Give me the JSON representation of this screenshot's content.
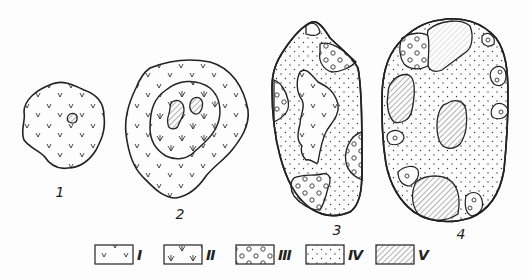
{
  "figure": {
    "type": "schematic diagram of zoned bodies (stages)",
    "stages": [
      {
        "id": "stage-1",
        "label": "1",
        "composition": [
          "I (v-pattern matrix)",
          "V (small hatched core)"
        ]
      },
      {
        "id": "stage-2",
        "label": "2",
        "composition": [
          "I (outer v-pattern zone)",
          "II (inner arrow-v zone)",
          "V (two hatched cores)"
        ]
      },
      {
        "id": "stage-3",
        "label": "3",
        "composition": [
          "IV (dotted matrix)",
          "I (central v-pattern relic)",
          "III (circle-pattern patches at margins)"
        ]
      },
      {
        "id": "stage-4",
        "label": "4",
        "composition": [
          "IV (dotted matrix)",
          "III (small circle-pattern patches)",
          "V (hatched bodies)"
        ]
      }
    ]
  },
  "legend": {
    "items": [
      {
        "key": "I",
        "pattern": "small-v-marks"
      },
      {
        "key": "II",
        "pattern": "arrow-v-marks"
      },
      {
        "key": "III",
        "pattern": "small-circles"
      },
      {
        "key": "IV",
        "pattern": "dots"
      },
      {
        "key": "V",
        "pattern": "diagonal-hatch"
      }
    ]
  },
  "colors": {
    "ink": "#222222",
    "background": "#fdfdfd",
    "hatch": "#555555"
  }
}
